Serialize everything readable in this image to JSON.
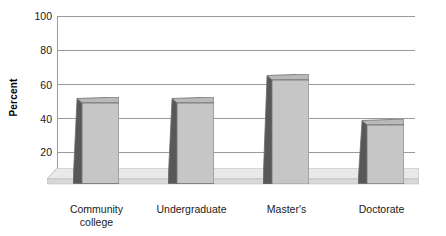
{
  "chart_data": {
    "type": "bar",
    "title": "",
    "xlabel": "",
    "ylabel": "Percent",
    "categories": [
      "Community college",
      "Undergraduate",
      "Master's",
      "Doctorate"
    ],
    "category_lines": [
      [
        "Community",
        "college"
      ],
      [
        "Undergraduate"
      ],
      [
        "Master's"
      ],
      [
        "Doctorate"
      ]
    ],
    "values": [
      48,
      48,
      62,
      35
    ],
    "ylim": [
      0,
      100
    ],
    "yticks": [
      0,
      20,
      40,
      60,
      80,
      100
    ],
    "ytick_labels": [
      "",
      "20",
      "40",
      "60",
      "80",
      "100"
    ],
    "grid": true,
    "legend": "none",
    "style": "3d-bar"
  },
  "colors": {
    "bar_front": "#c6c6c6",
    "bar_side": "#585858",
    "bar_outline": "#6e6e6e",
    "gridline": "#9a9a9a",
    "floor_top": "#e6e6e6",
    "floor_front": "#d2d2d2",
    "text": "#1a1a1a",
    "background": "#ffffff"
  },
  "axis": {
    "y_title": "Percent",
    "tick_100": "100",
    "tick_80": "80",
    "tick_60": "60",
    "tick_40": "40",
    "tick_20": "20"
  }
}
